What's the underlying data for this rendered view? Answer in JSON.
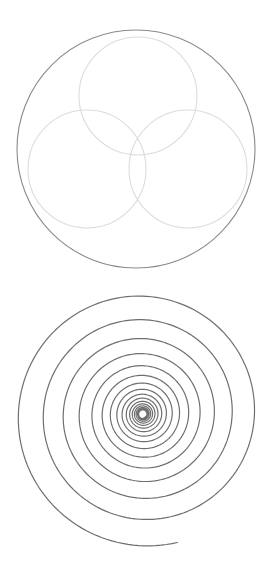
{
  "canvas": {
    "width": 280,
    "height": 587,
    "background": "#ffffff"
  },
  "figures": {
    "circles_figure": {
      "outer_circle": {
        "cx": 136,
        "cy": 149,
        "r": 119,
        "stroke": "#8a8a8a",
        "stroke_width": 1.1
      },
      "inner_circles": [
        {
          "name": "top",
          "cx": 138,
          "cy": 96,
          "r": 59,
          "stroke": "#dcdcdc",
          "stroke_width": 1.1
        },
        {
          "name": "bottom-left",
          "cx": 87,
          "cy": 169,
          "r": 59,
          "stroke": "#dcdcdc",
          "stroke_width": 1.1
        },
        {
          "name": "bottom-right",
          "cx": 188,
          "cy": 169,
          "r": 59,
          "stroke": "#dcdcdc",
          "stroke_width": 1.1
        }
      ]
    },
    "spiral_figure": {
      "cx": 143,
      "cy": 414,
      "start_radius": 133,
      "start_angle_deg": 75,
      "ratio_per_turn": 0.8,
      "turns": 16,
      "inner_hole_radius": 3,
      "direction": "clockwise-inward",
      "stroke": "#6e6e6e",
      "stroke_width": 1.2
    }
  }
}
